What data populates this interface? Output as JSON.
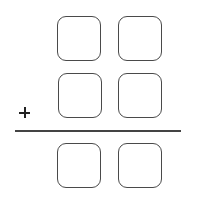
{
  "problem": {
    "operator": "+",
    "rows": [
      {
        "name": "addend-1",
        "digits": [
          "",
          ""
        ]
      },
      {
        "name": "addend-2",
        "digits": [
          "",
          ""
        ]
      },
      {
        "name": "sum",
        "digits": [
          "",
          ""
        ]
      }
    ]
  }
}
